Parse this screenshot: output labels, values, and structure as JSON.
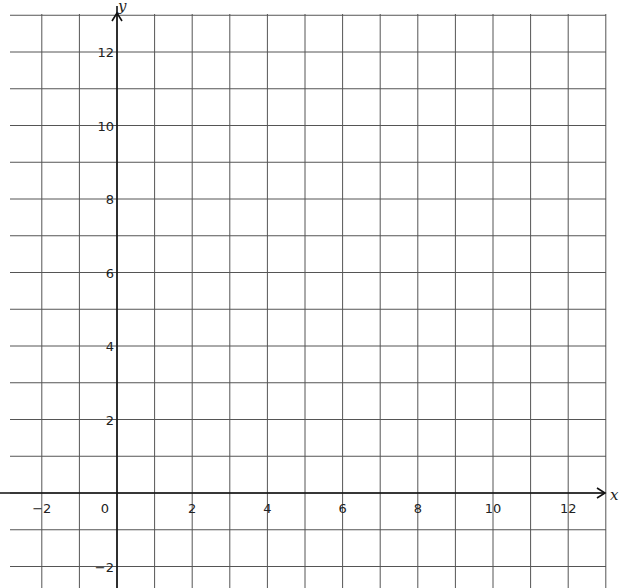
{
  "chart_data": {
    "type": "scatter",
    "title": "",
    "xlabel": "x",
    "ylabel": "y",
    "xlim": [
      -3,
      13
    ],
    "ylim": [
      -3,
      13
    ],
    "grid": true,
    "grid_step": 1,
    "x_ticks": [
      -2,
      0,
      2,
      4,
      6,
      8,
      10,
      12
    ],
    "y_ticks": [
      -2,
      2,
      4,
      6,
      8,
      10,
      12
    ],
    "x_tick_labels": [
      "−2",
      "0",
      "2",
      "4",
      "6",
      "8",
      "10",
      "12"
    ],
    "y_tick_labels": [
      "−2",
      "2",
      "4",
      "6",
      "8",
      "10",
      "12"
    ],
    "origin_label": "0",
    "series": [],
    "legend": null
  },
  "colors": {
    "grid": "#555555",
    "axis": "#111111",
    "text": "#222222",
    "background": "#ffffff"
  }
}
